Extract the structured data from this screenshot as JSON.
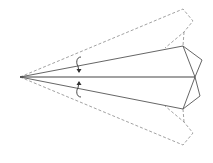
{
  "diagram": {
    "colors": {
      "background": "#ffffff",
      "dashed_line": "#8a8a8a",
      "solid_line": "#555555",
      "center_line": "#444444",
      "arrow": "#333333"
    },
    "elements": [
      {
        "name": "outer-wing-dashed-outline",
        "style": "dashed"
      },
      {
        "name": "folded-wing-solid-outline",
        "style": "solid"
      },
      {
        "name": "center-fold-line",
        "style": "solid"
      },
      {
        "name": "fold-arrow-top",
        "direction": "down"
      },
      {
        "name": "fold-arrow-bottom",
        "direction": "up"
      }
    ]
  }
}
